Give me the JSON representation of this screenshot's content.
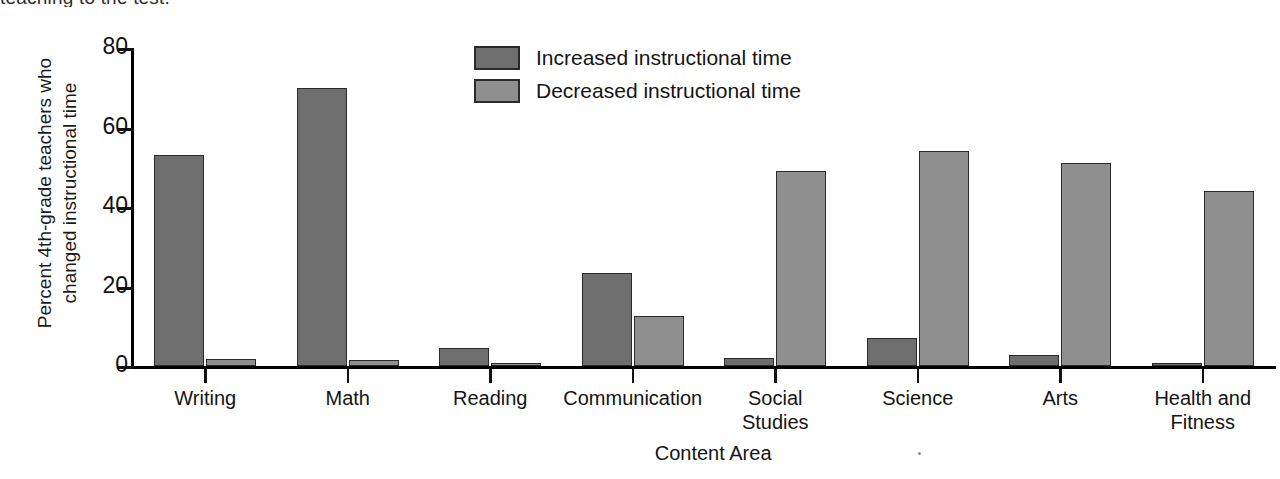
{
  "caption_fragment": "teaching to the test.",
  "chart_data": {
    "type": "bar",
    "title": "",
    "xlabel": "Content Area",
    "ylabel": "Percent 4th-grade teachers who\nchanged instructional time",
    "ylim": [
      0,
      80
    ],
    "yticks": [
      "0",
      "20",
      "40",
      "60",
      "80"
    ],
    "ytick_values": [
      0,
      20,
      40,
      60,
      80
    ],
    "grid": false,
    "legend_position": "top-center",
    "categories": [
      "Writing",
      "Math",
      "Reading",
      "Communication",
      "Social\nStudies",
      "Science",
      "Arts",
      "Health and\nFitness"
    ],
    "series": [
      {
        "name": "Increased instructional time",
        "color": "#6e6e6e",
        "values": [
          53,
          70,
          4.5,
          23.5,
          2,
          7,
          2.7,
          0.3
        ]
      },
      {
        "name": "Decreased instructional time",
        "color": "#8f8f8f",
        "values": [
          1.8,
          1.5,
          0.6,
          12.5,
          49,
          54,
          51,
          44
        ]
      }
    ]
  },
  "colors": {
    "increased": "#6e6e6e",
    "decreased": "#8f8f8f",
    "axis": "#111111",
    "bar_border": "#2a2a2a"
  }
}
